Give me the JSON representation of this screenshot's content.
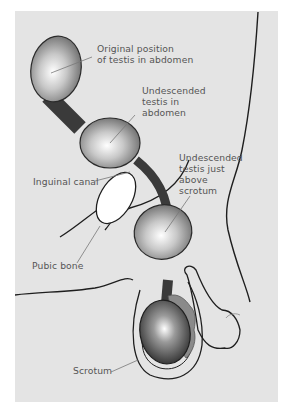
{
  "diagram": {
    "type": "anatomical-illustration",
    "colors": {
      "background": "#e4e4e4",
      "outline": "#1e1e1e",
      "cord": "#3a3a3a",
      "testis_highlight": "#ffffff",
      "testis_shadow": "#555555",
      "pubic_bone": "#ffffff",
      "label_text": "#555555",
      "leader_line": "#777777"
    },
    "labels": [
      {
        "id": "original-position",
        "text": "Original position\nof testis in abdomen"
      },
      {
        "id": "undescended-abdomen",
        "text": "Undescended\ntestis in\nabdomen"
      },
      {
        "id": "inguinal-canal",
        "text": "Inguinal canal"
      },
      {
        "id": "undescended-above-scrotum",
        "text": "Undescended\ntestis just\nabove\nscrotum"
      },
      {
        "id": "pubic-bone",
        "text": "Pubic bone"
      },
      {
        "id": "scrotum",
        "text": "Scrotum"
      }
    ]
  }
}
